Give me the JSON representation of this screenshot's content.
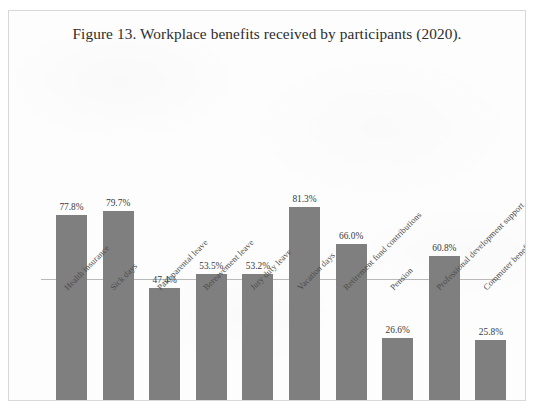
{
  "figure": {
    "title": "Figure 13. Workplace benefits received by participants (2020)."
  },
  "style": {
    "bar_color": "#7f7f7f",
    "axis_color": "#b9b9b9",
    "border_color": "#d8d8d8",
    "background": "#fdfdfd",
    "text_color": "#2c2c2c"
  },
  "chart_data": {
    "type": "bar",
    "title": "Figure 13. Workplace benefits received by participants (2020).",
    "xlabel": "",
    "ylabel": "",
    "ylim": [
      0,
      100
    ],
    "grid": false,
    "legend": false,
    "value_suffix": "%",
    "categories": [
      "Health insurance",
      "Sick days",
      "Paid parental leave",
      "Bereavement leave",
      "Jury duty leave",
      "Vacation days",
      "Retirement fund contributions",
      "Pension",
      "Professional development support",
      "Commuter benefits"
    ],
    "values": [
      77.8,
      79.7,
      47.4,
      53.5,
      53.2,
      81.3,
      66.0,
      26.6,
      60.8,
      25.8
    ],
    "value_labels": [
      "77.8%",
      "79.7%",
      "47.4%",
      "53.5%",
      "53.2%",
      "81.3%",
      "66.0%",
      "26.6%",
      "60.8%",
      "25.8%"
    ]
  }
}
